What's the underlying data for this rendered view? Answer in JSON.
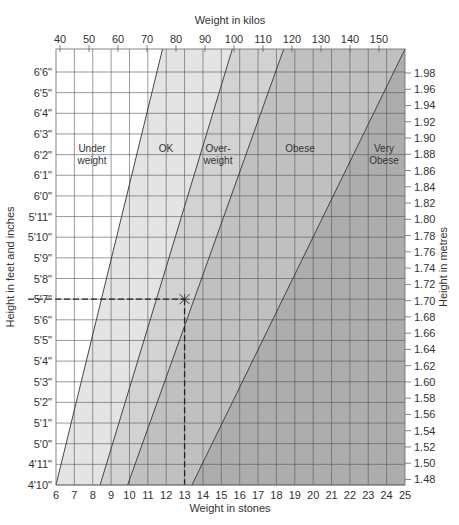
{
  "chart_data": {
    "type": "area",
    "title": "",
    "top_axis": {
      "label": "Weight in kilos",
      "ticks": [
        40,
        50,
        60,
        70,
        80,
        90,
        100,
        110,
        120,
        130,
        140,
        150
      ]
    },
    "bottom_axis": {
      "label": "Weight in stones",
      "ticks": [
        6,
        7,
        8,
        9,
        10,
        11,
        12,
        13,
        14,
        15,
        16,
        17,
        18,
        19,
        20,
        21,
        22,
        23,
        24,
        25
      ],
      "range": [
        6,
        25
      ]
    },
    "left_axis": {
      "label": "Height in feet and inches",
      "ticks": [
        "6'6\"",
        "6'5\"",
        "6'4\"",
        "6'3\"",
        "6'2\"",
        "6'1\"",
        "6'0\"",
        "5'11\"",
        "5'10\"",
        "5'9\"",
        "5'8\"",
        "5'7\"",
        "5'6\"",
        "5'5\"",
        "5'4\"",
        "5'3\"",
        "5'2\"",
        "5'1\"",
        "5'0\"",
        "4'11\"",
        "4'10\""
      ]
    },
    "right_axis": {
      "label": "Height in metres",
      "ticks": [
        "1.98",
        "1.96",
        "1.94",
        "1.92",
        "1.90",
        "1.88",
        "1.86",
        "1.84",
        "1.82",
        "1.80",
        "1.78",
        "1.76",
        "1.74",
        "1.72",
        "1.70",
        "1.68",
        "1.66",
        "1.64",
        "1.62",
        "1.60",
        "1.58",
        "1.56",
        "1.54",
        "1.52",
        "1.50",
        "1.48"
      ]
    },
    "regions": [
      {
        "name": "Under weight",
        "label_lines": [
          "Under",
          "weight"
        ],
        "color": "#ffffff"
      },
      {
        "name": "OK",
        "label_lines": [
          "OK"
        ],
        "color": "#e4e4e4"
      },
      {
        "name": "Over-weight",
        "label_lines": [
          "Over-",
          "weight"
        ],
        "color": "#d2d2d2"
      },
      {
        "name": "Obese",
        "label_lines": [
          "Obese"
        ],
        "color": "#c0c0c0"
      },
      {
        "name": "Very Obese",
        "label_lines": [
          "Very",
          "Obese"
        ],
        "color": "#adadad"
      }
    ],
    "boundaries_stones": [
      {
        "between": "Under weight / OK",
        "at_4ft10": 6.0,
        "at_6ft7": 11.8
      },
      {
        "between": "OK / Over-weight",
        "at_4ft10": 8.4,
        "at_6ft7": 15.6
      },
      {
        "between": "Over-weight / Obese",
        "at_4ft10": 9.9,
        "at_6ft7": 18.4
      },
      {
        "between": "Obese / Very Obese",
        "at_4ft10": 13.4,
        "at_6ft7": 25.0
      }
    ],
    "example_point": {
      "weight_stones": 13,
      "height": "5'7\"",
      "height_m": 1.7,
      "marker": "x",
      "guide_lines": "dashed"
    },
    "grid": true
  }
}
